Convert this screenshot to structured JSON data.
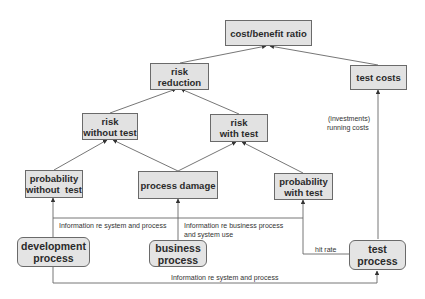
{
  "diagram": {
    "type": "flow-diagram",
    "colors": {
      "node_fill": "#e2e2e2",
      "node_border": "#6a6a6a",
      "edge": "#555555",
      "text": "#2a2a2a"
    },
    "nodes": {
      "cost_benefit_ratio": {
        "label": "cost/benefit ratio",
        "shape": "rectangle"
      },
      "risk_reduction": {
        "label": "risk\nreduction",
        "line1": "risk",
        "line2": "reduction",
        "shape": "rectangle"
      },
      "test_costs": {
        "label": "test costs",
        "shape": "rectangle"
      },
      "risk_without_test": {
        "line1": "risk",
        "line2": "without test",
        "shape": "rectangle"
      },
      "risk_with_test": {
        "line1": "risk",
        "line2": "with test",
        "shape": "rectangle"
      },
      "probability_without_test": {
        "line1": "probability",
        "line2": "without  test",
        "shape": "rectangle"
      },
      "process_damage": {
        "label": "process damage",
        "shape": "rectangle"
      },
      "probability_with_test": {
        "line1": "probability",
        "line2": "with test",
        "shape": "rectangle"
      },
      "development_process": {
        "line1": "development",
        "line2": "process",
        "shape": "rounded-rectangle"
      },
      "business_process": {
        "line1": "business",
        "line2": "process",
        "shape": "rounded-rectangle"
      },
      "test_process": {
        "label": "test process",
        "shape": "rounded-rectangle"
      }
    },
    "edge_labels": {
      "dev_info": "Information re system and process",
      "business_info_1": "Information re business process",
      "business_info_2": "and system use",
      "hit_rate": "hit rate",
      "dev_to_test_info": "Information re system and process",
      "costs_1": "(investments)",
      "costs_2": "running costs"
    },
    "edges": [
      {
        "from": "risk_reduction",
        "to": "cost_benefit_ratio"
      },
      {
        "from": "test_costs",
        "to": "cost_benefit_ratio"
      },
      {
        "from": "risk_without_test",
        "to": "risk_reduction"
      },
      {
        "from": "risk_with_test",
        "to": "risk_reduction"
      },
      {
        "from": "probability_without_test",
        "to": "risk_without_test"
      },
      {
        "from": "process_damage",
        "to": "risk_without_test"
      },
      {
        "from": "process_damage",
        "to": "risk_with_test"
      },
      {
        "from": "probability_with_test",
        "to": "risk_with_test"
      },
      {
        "from": "development_process",
        "to": "probability_without_test"
      },
      {
        "from": "development_process",
        "to": "probability_with_test",
        "label": "Information re system and process"
      },
      {
        "from": "business_process",
        "to": "process_damage",
        "label": "Information re business process and system use"
      },
      {
        "from": "test_process",
        "to": "probability_with_test",
        "label": "hit rate"
      },
      {
        "from": "test_process",
        "to": "test_costs",
        "label": "(investments) running costs"
      },
      {
        "from": "development_process",
        "to": "test_process",
        "label": "Information re system and process"
      }
    ]
  }
}
